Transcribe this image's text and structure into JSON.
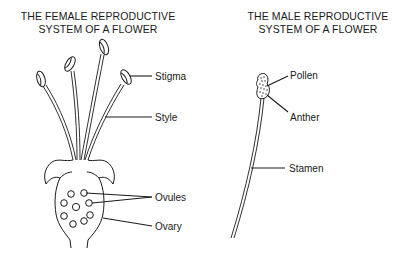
{
  "female": {
    "title_line1": "THE FEMALE REPRODUCTIVE",
    "title_line2": "SYSTEM OF A FLOWER",
    "labels": {
      "stigma": "Stigma",
      "style": "Style",
      "ovules": "Ovules",
      "ovary": "Ovary"
    }
  },
  "male": {
    "title_line1": "THE MALE REPRODUCTIVE",
    "title_line2": "SYSTEM OF A FLOWER",
    "labels": {
      "pollen": "Pollen",
      "anther": "Anther",
      "stamen": "Stamen"
    }
  },
  "colors": {
    "ink": "#1a1a1a",
    "background": "#ffffff"
  }
}
